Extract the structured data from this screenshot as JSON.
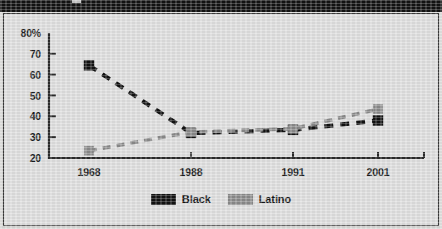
{
  "header": {
    "bar_color": "#121212",
    "title": ""
  },
  "frame": {
    "background": "#dedede",
    "border_color": "#3a3a3a"
  },
  "legend": {
    "position": "bottom-center",
    "entries": [
      {
        "label": "Black",
        "color": "#111111",
        "icon": "square-swatch"
      },
      {
        "label": "Latino",
        "color": "#8a8a8a",
        "icon": "square-swatch"
      }
    ]
  },
  "chart_data": {
    "type": "line",
    "title": "",
    "xlabel": "",
    "ylabel": "",
    "x": [
      "1968",
      "1988",
      "1991",
      "2001"
    ],
    "categories": [
      "1968",
      "1988",
      "1991",
      "2001"
    ],
    "ytick_labels": [
      "80%",
      "70",
      "60",
      "50",
      "40",
      "30",
      "20"
    ],
    "ytick_values": [
      80,
      70,
      60,
      50,
      40,
      30,
      20
    ],
    "ylim": [
      20,
      80
    ],
    "grid": false,
    "line_style": "dashed",
    "marker": "square",
    "series": [
      {
        "name": "Black",
        "color": "#111111",
        "values": [
          64.5,
          32.0,
          33.5,
          38.0
        ]
      },
      {
        "name": "Latino",
        "color": "#8a8a8a",
        "values": [
          23.5,
          32.5,
          34.0,
          43.5
        ]
      }
    ]
  }
}
